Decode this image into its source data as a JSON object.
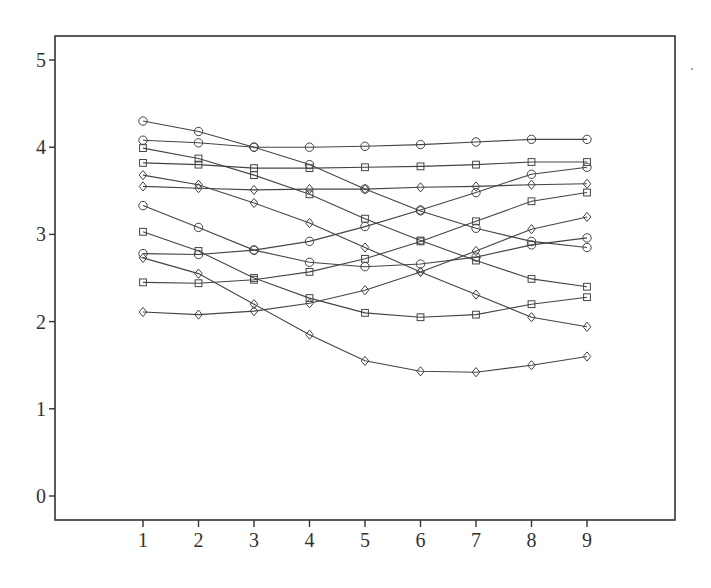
{
  "chart_data": {
    "type": "line",
    "title": "",
    "xlabel": "",
    "ylabel": "",
    "x": [
      1,
      2,
      3,
      4,
      5,
      6,
      7,
      8,
      9
    ],
    "x_tick_labels": [
      "1",
      "2",
      "3",
      "4",
      "5",
      "6",
      "7",
      "8",
      "9"
    ],
    "y_ticks": [
      0,
      1,
      2,
      3,
      4,
      5
    ],
    "y_tick_labels": [
      "0",
      "1",
      "2",
      "3",
      "4",
      "5"
    ],
    "ylim": [
      -0.28,
      5.27
    ],
    "xlim": [
      -0.6,
      11.2
    ],
    "grid": false,
    "legend": null,
    "series": [
      {
        "name": "series-1",
        "marker": "circle",
        "values": [
          4.3,
          4.18,
          4.0,
          3.8,
          3.52,
          3.27,
          3.07,
          2.92,
          2.85
        ]
      },
      {
        "name": "series-2",
        "marker": "circle",
        "values": [
          4.08,
          4.05,
          4.0,
          4.0,
          4.01,
          4.03,
          4.06,
          4.09,
          4.09
        ]
      },
      {
        "name": "series-3",
        "marker": "square",
        "values": [
          3.99,
          3.87,
          3.68,
          3.46,
          3.18,
          2.93,
          2.7,
          2.49,
          2.4
        ]
      },
      {
        "name": "series-4",
        "marker": "square",
        "values": [
          3.82,
          3.8,
          3.76,
          3.76,
          3.77,
          3.78,
          3.8,
          3.83,
          3.83
        ]
      },
      {
        "name": "series-5",
        "marker": "diamond",
        "values": [
          3.68,
          3.57,
          3.36,
          3.13,
          2.85,
          2.57,
          2.31,
          2.05,
          1.94
        ]
      },
      {
        "name": "series-6",
        "marker": "diamond",
        "values": [
          3.55,
          3.53,
          3.51,
          3.52,
          3.52,
          3.54,
          3.55,
          3.57,
          3.58
        ]
      },
      {
        "name": "series-7",
        "marker": "circle",
        "values": [
          3.33,
          3.08,
          2.82,
          2.68,
          2.63,
          2.66,
          2.74,
          2.88,
          2.96
        ]
      },
      {
        "name": "series-8",
        "marker": "square",
        "values": [
          3.03,
          2.81,
          2.5,
          2.27,
          2.1,
          2.05,
          2.08,
          2.2,
          2.28
        ]
      },
      {
        "name": "series-9",
        "marker": "circle",
        "values": [
          2.78,
          2.77,
          2.82,
          2.92,
          3.09,
          3.28,
          3.48,
          3.69,
          3.77
        ]
      },
      {
        "name": "series-10",
        "marker": "diamond",
        "values": [
          2.73,
          2.55,
          2.2,
          1.85,
          1.55,
          1.43,
          1.42,
          1.5,
          1.6
        ]
      },
      {
        "name": "series-11",
        "marker": "square",
        "values": [
          2.45,
          2.44,
          2.48,
          2.57,
          2.72,
          2.92,
          3.15,
          3.38,
          3.48
        ]
      },
      {
        "name": "series-12",
        "marker": "diamond",
        "values": [
          2.11,
          2.08,
          2.12,
          2.21,
          2.36,
          2.57,
          2.81,
          3.06,
          3.2
        ]
      }
    ]
  },
  "layout": {
    "frame": {
      "left": 55,
      "top": 36,
      "right": 675,
      "bottom": 520
    },
    "x_origin_px": 143,
    "x_step_px": 55.5,
    "y_zero_px": 496,
    "y_unit_px": 87.2,
    "colors": {
      "axis": "#333333",
      "line": "#444444",
      "background": "#ffffff"
    }
  }
}
